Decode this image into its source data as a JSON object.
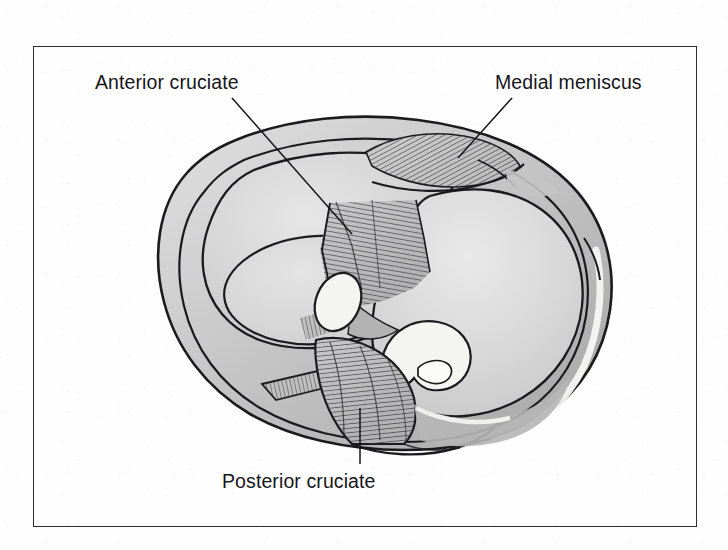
{
  "figure": {
    "kind": "anatomical-illustration",
    "frame": {
      "visible": true,
      "border_color": "#2e2e30"
    },
    "background_color": "#fefefe"
  },
  "labels": [
    {
      "id": "anterior-cruciate",
      "text": "Anterior cruciate",
      "position": "upper-left",
      "leader": "diagonal line descending to the right toward the central fanned ligament fibres"
    },
    {
      "id": "medial-meniscus",
      "text": "Medial meniscus",
      "position": "upper-right",
      "leader": "short diagonal line descending to the left into the hatched crescent"
    },
    {
      "id": "posterior-cruciate",
      "text": "Posterior cruciate",
      "position": "bottom-center",
      "leader": "vertical line rising into the striated posterior band"
    }
  ],
  "structures": [
    {
      "id": "tibial-plateau-rim",
      "name": "Tibial plateau outer rim",
      "shading": "grey gradient with double contour"
    },
    {
      "id": "lateral-fossa",
      "name": "Lateral articular fossa",
      "shading": "oval depression, left side"
    },
    {
      "id": "medial-fossa",
      "name": "Medial articular fossa",
      "shading": "large teardrop concavity, right side"
    },
    {
      "id": "medial-meniscus-fan",
      "name": "Medial meniscus",
      "shading": "radiating hatch lines, upper right"
    },
    {
      "id": "anterior-cruciate-fan",
      "name": "Anterior cruciate ligament",
      "shading": "fanned striated fibres, centre"
    },
    {
      "id": "posterior-cruciate-band",
      "name": "Posterior cruciate ligament",
      "shading": "striated vertical band, lower centre"
    },
    {
      "id": "tibial-spine-medial",
      "name": "Medial intercondylar eminence",
      "shading": "white highlighted prominence"
    },
    {
      "id": "tibial-spine-lateral",
      "name": "Lateral intercondylar eminence",
      "shading": "white highlighted prominence"
    },
    {
      "id": "rim-highlight",
      "name": "Lateral rim highlight band",
      "shading": "pale band inside the right margin"
    }
  ],
  "palette": {
    "ink": "#1b1b1e",
    "rim_light": "#d6d6d6",
    "rim_mid": "#bcbcbc",
    "rim_dark": "#a4a4a4",
    "fossa_light": "#e2e2e2",
    "fossa_mid": "#cfcfcf",
    "hatch": "#3a3a3d",
    "highlight": "#f6f6f4",
    "spine_white": "#f4f4f1",
    "frame_border": "#2e2e30"
  }
}
